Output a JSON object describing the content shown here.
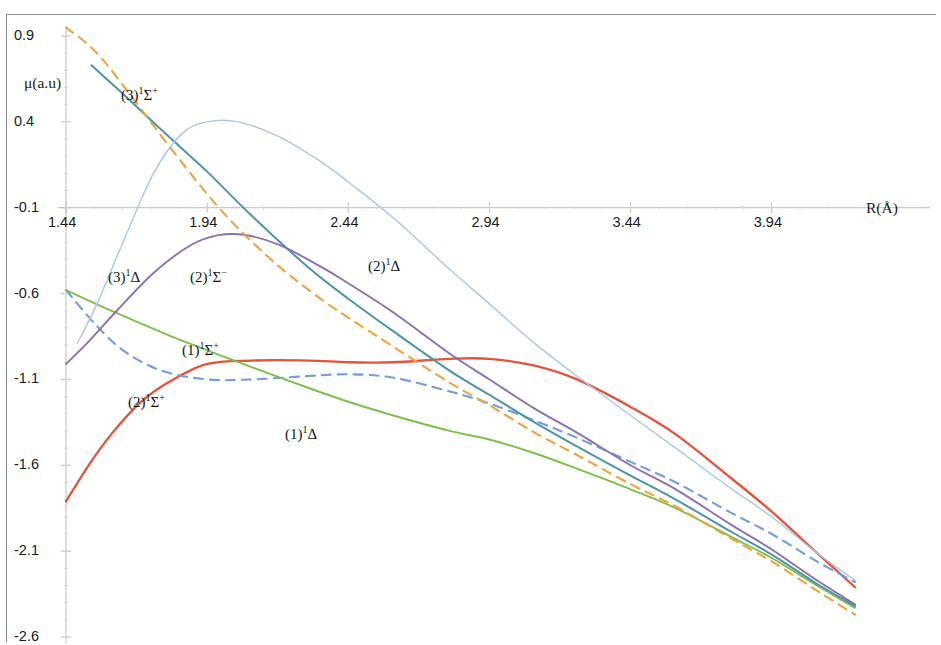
{
  "chart_data": {
    "type": "line",
    "title": "",
    "xlabel": "R(Å)",
    "ylabel": "μ(a.u)",
    "xlim": [
      1.44,
      4.235
    ],
    "ylim": [
      -2.6,
      0.9
    ],
    "grid": false,
    "legend_position": "inline-annotations",
    "xticks": [
      1.44,
      1.94,
      2.44,
      2.94,
      3.44,
      3.94
    ],
    "xticklabels": [
      "1.44",
      "1.94",
      "2.44",
      "2.94",
      "3.44",
      "3.94"
    ],
    "yticks": [
      0.9,
      0.4,
      -0.1,
      -0.6,
      -1.1,
      -1.6,
      -2.1,
      -2.6
    ],
    "yticklabels": [
      "0.9",
      "0.4",
      "-0.1",
      "-0.6",
      "-1.1",
      "-1.6",
      "-2.1",
      "-2.6"
    ],
    "series": [
      {
        "name": "(1)1Sigma+",
        "label_html": "(1)<sup>1</sup>Σ<sup>+</sup>",
        "color": "#e8513a",
        "dash": "none",
        "width": 2.3,
        "x": [
          1.44,
          1.52,
          1.6,
          1.7,
          1.8,
          1.94,
          2.1,
          2.3,
          2.44,
          2.6,
          2.8,
          2.94,
          3.1,
          3.25,
          3.44,
          3.6,
          3.8,
          3.94,
          4.1,
          4.235
        ],
        "y": [
          -1.81,
          -1.6,
          -1.42,
          -1.24,
          -1.12,
          -1.01,
          -0.99,
          -0.99,
          -1.0,
          -1.0,
          -0.98,
          -0.98,
          -1.02,
          -1.1,
          -1.26,
          -1.42,
          -1.68,
          -1.87,
          -2.11,
          -2.31
        ]
      },
      {
        "name": "(2)1Sigma+",
        "label_html": "(2)<sup>1</sup>Σ<sup>+</sup>",
        "color": "#6f9fe0",
        "dash": "dashed",
        "width": 2.1,
        "x": [
          1.44,
          1.55,
          1.65,
          1.78,
          1.94,
          2.1,
          2.3,
          2.44,
          2.6,
          2.8,
          2.94,
          3.1,
          3.25,
          3.44,
          3.6,
          3.8,
          3.94,
          4.1,
          4.235
        ],
        "y": [
          -0.58,
          -0.79,
          -0.94,
          -1.05,
          -1.1,
          -1.1,
          -1.08,
          -1.07,
          -1.09,
          -1.17,
          -1.24,
          -1.34,
          -1.44,
          -1.58,
          -1.7,
          -1.88,
          -2.0,
          -2.16,
          -2.28
        ]
      },
      {
        "name": "(1)1Delta",
        "label_html": "(1)<sup>1</sup>Δ",
        "color": "#7cc04a",
        "dash": "none",
        "width": 1.9,
        "x": [
          1.44,
          1.6,
          1.8,
          1.94,
          2.1,
          2.3,
          2.44,
          2.6,
          2.8,
          2.94,
          3.1,
          3.25,
          3.44,
          3.6,
          3.8,
          3.94,
          4.1,
          4.235
        ],
        "y": [
          -0.58,
          -0.7,
          -0.84,
          -0.93,
          -1.03,
          -1.15,
          -1.23,
          -1.31,
          -1.4,
          -1.45,
          -1.53,
          -1.62,
          -1.74,
          -1.85,
          -2.02,
          -2.14,
          -2.3,
          -2.43
        ]
      },
      {
        "name": "(3)1Sigma+",
        "label_html": "(3)<sup>1</sup>Σ<sup>+</sup>",
        "color": "#4c94a8",
        "dash": "none",
        "width": 2.0,
        "x": [
          1.53,
          1.65,
          1.8,
          1.94,
          2.1,
          2.3,
          2.44,
          2.6,
          2.8,
          2.94,
          3.1,
          3.25,
          3.44,
          3.6,
          3.8,
          3.94,
          4.1,
          4.235
        ],
        "y": [
          0.73,
          0.55,
          0.32,
          0.11,
          -0.15,
          -0.45,
          -0.63,
          -0.82,
          -1.05,
          -1.19,
          -1.35,
          -1.49,
          -1.66,
          -1.8,
          -1.99,
          -2.12,
          -2.29,
          -2.42
        ]
      },
      {
        "name": "(2)1Delta",
        "label_html": "(2)<sup>1</sup>Δ",
        "color": "#a8c8e8",
        "dash": "none",
        "width": 1.4,
        "x": [
          1.48,
          1.55,
          1.65,
          1.75,
          1.85,
          1.94,
          2.05,
          2.2,
          2.35,
          2.44,
          2.6,
          2.8,
          2.94,
          3.1,
          3.25,
          3.44,
          3.6,
          3.8,
          3.94,
          4.1,
          4.235
        ],
        "y": [
          -0.89,
          -0.66,
          -0.27,
          0.1,
          0.33,
          0.4,
          0.4,
          0.31,
          0.16,
          0.05,
          -0.16,
          -0.46,
          -0.66,
          -0.89,
          -1.08,
          -1.31,
          -1.5,
          -1.74,
          -1.9,
          -2.11,
          -2.27
        ]
      },
      {
        "name": "(3)1Delta",
        "label_html": "(3)<sup>1</sup>Δ",
        "color": "#8b6fb0",
        "dash": "none",
        "width": 1.9,
        "x": [
          1.44,
          1.52,
          1.62,
          1.75,
          1.88,
          1.98,
          2.08,
          2.2,
          2.35,
          2.44,
          2.6,
          2.8,
          2.94,
          3.1,
          3.25,
          3.44,
          3.6,
          3.8,
          3.94,
          4.1,
          4.235
        ],
        "y": [
          -1.01,
          -0.88,
          -0.7,
          -0.48,
          -0.32,
          -0.26,
          -0.26,
          -0.32,
          -0.45,
          -0.54,
          -0.71,
          -0.95,
          -1.1,
          -1.27,
          -1.41,
          -1.6,
          -1.74,
          -1.95,
          -2.09,
          -2.27,
          -2.41
        ]
      },
      {
        "name": "(2)1Sigma-",
        "label_html": "(2)<sup>1</sup>Σ<sup>−</sup>",
        "color": "#f0a33c",
        "dash": "dashed",
        "width": 2.1,
        "x": [
          1.44,
          1.55,
          1.68,
          1.8,
          1.94,
          2.05,
          2.2,
          2.35,
          2.44,
          2.6,
          2.8,
          2.94,
          3.1,
          3.25,
          3.44,
          3.6,
          3.8,
          3.94,
          4.1,
          4.235
        ],
        "y": [
          0.95,
          0.8,
          0.53,
          0.27,
          -0.02,
          -0.22,
          -0.45,
          -0.64,
          -0.74,
          -0.91,
          -1.12,
          -1.25,
          -1.41,
          -1.54,
          -1.71,
          -1.84,
          -2.03,
          -2.16,
          -2.33,
          -2.47
        ]
      }
    ],
    "annotations": [
      {
        "text_html": "(3)<sup>1</sup>Σ<sup>+</sup>",
        "x_px": 121,
        "y_px": 85
      },
      {
        "text_html": "(3)<sup>1</sup>Δ",
        "x_px": 108,
        "y_px": 267
      },
      {
        "text_html": "(2)<sup>1</sup>Σ<sup>−</sup>",
        "x_px": 190,
        "y_px": 267
      },
      {
        "text_html": "(2)<sup>1</sup>Δ",
        "x_px": 368,
        "y_px": 256
      },
      {
        "text_html": "(1)<sup>1</sup>Σ<sup>+</sup>",
        "x_px": 182,
        "y_px": 340
      },
      {
        "text_html": "(2)<sup>1</sup>Σ<sup>+</sup>",
        "x_px": 128,
        "y_px": 392
      },
      {
        "text_html": "(1)<sup>1</sup>Δ",
        "x_px": 285,
        "y_px": 424
      }
    ],
    "colors": {
      "axis": "#b8bcc0",
      "frame": "#8b8f93",
      "text": "#1b1b1b",
      "background": "#ffffff"
    }
  }
}
